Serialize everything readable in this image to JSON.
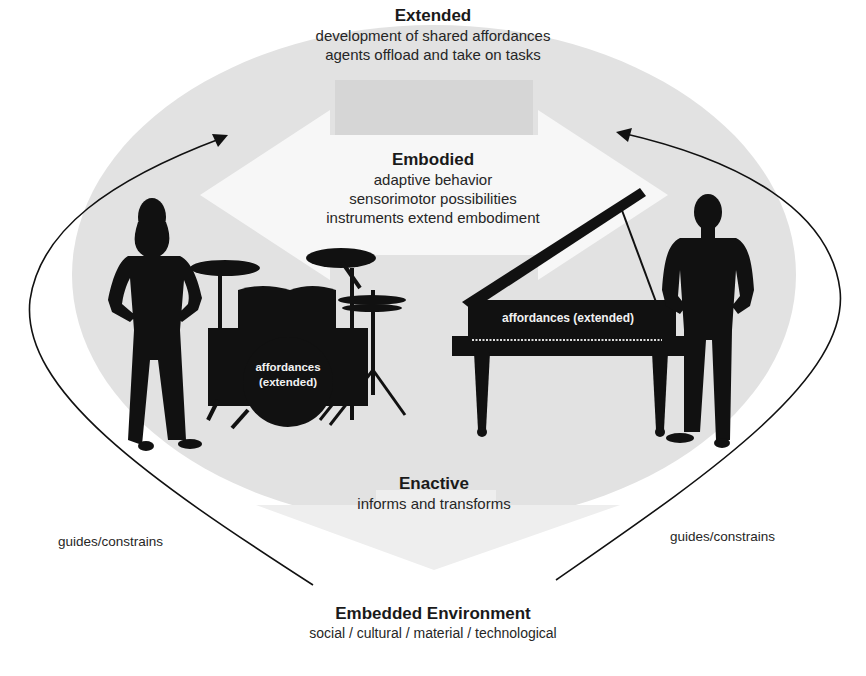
{
  "colors": {
    "ellipse": "#e2e2e2",
    "arrow_fill": "#f6f6f6",
    "silhouette": "#111111",
    "line": "#111111",
    "background": "#ffffff"
  },
  "extended": {
    "title": "Extended",
    "lines": [
      "development of shared affordances",
      "agents offload and take on tasks"
    ]
  },
  "embodied": {
    "title": "Embodied",
    "lines": [
      "adaptive behavior",
      "sensorimotor possibilities",
      "instruments extend embodiment"
    ]
  },
  "enactive": {
    "title": "Enactive",
    "lines": [
      "informs and transforms"
    ]
  },
  "environment": {
    "title": "Embedded Environment",
    "subtitle": "social / cultural / material / technological"
  },
  "side_labels": {
    "left": "guides/constrains",
    "right": "guides/constrains"
  },
  "instruments": {
    "drums": {
      "line1": "affordances",
      "line2": "(extended)"
    },
    "piano": {
      "label": "affordances (extended)"
    }
  },
  "figures": [
    "woman-silhouette",
    "man-silhouette",
    "drum-kit",
    "grand-piano"
  ]
}
